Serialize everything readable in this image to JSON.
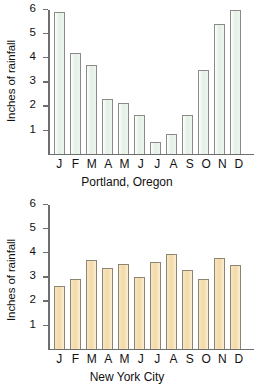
{
  "chart_data": [
    {
      "type": "bar",
      "title": "Portland, Oregon",
      "xlabel": "Portland, Oregon",
      "ylabel": "Inches of rainfall",
      "ylim": [
        0,
        6
      ],
      "yticks": [
        1,
        2,
        3,
        4,
        5,
        6
      ],
      "grid": false,
      "legend": "none",
      "bar_color": "#e8f1e8",
      "bar_border_color": "#8a8a8a",
      "categories": [
        "J",
        "F",
        "M",
        "A",
        "M",
        "J",
        "J",
        "A",
        "S",
        "O",
        "N",
        "D"
      ],
      "values": [
        5.9,
        4.2,
        3.7,
        2.3,
        2.1,
        1.6,
        0.5,
        0.8,
        1.6,
        3.5,
        5.4,
        6.0
      ]
    },
    {
      "type": "bar",
      "title": "New York City",
      "xlabel": "New York City",
      "ylabel": "Inches of rainfall",
      "ylim": [
        0,
        6
      ],
      "yticks": [
        1,
        2,
        3,
        4,
        5,
        6
      ],
      "grid": false,
      "legend": "none",
      "bar_color": "#f5ddb0",
      "bar_border_color": "#8d8472",
      "categories": [
        "J",
        "F",
        "M",
        "A",
        "M",
        "J",
        "J",
        "A",
        "S",
        "O",
        "N",
        "D"
      ],
      "values": [
        2.6,
        2.9,
        3.7,
        3.35,
        3.55,
        3.0,
        3.6,
        3.95,
        3.3,
        2.9,
        3.8,
        3.5
      ]
    }
  ]
}
